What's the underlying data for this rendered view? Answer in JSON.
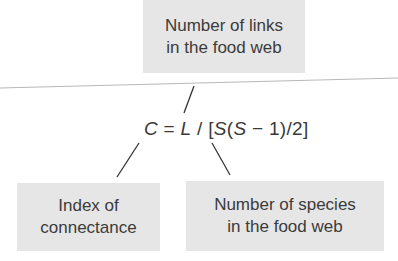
{
  "diagram": {
    "top_box": {
      "line1": "Number of links",
      "line2": "in the food web"
    },
    "formula": {
      "parts": [
        "C",
        " = ",
        "L",
        " / [",
        "S",
        "(",
        "S",
        " − 1)/2]"
      ],
      "full_text": "C = L / [S(S − 1)/2]"
    },
    "left_box": {
      "line1": "Index of",
      "line2": "connectance"
    },
    "right_box": {
      "line1": "Number of species",
      "line2": "in the food web"
    },
    "colors": {
      "box_fill": "#e6e6e6",
      "text": "#3a3a3a",
      "divider": "#b8b8b8",
      "connector": "#333333"
    }
  }
}
